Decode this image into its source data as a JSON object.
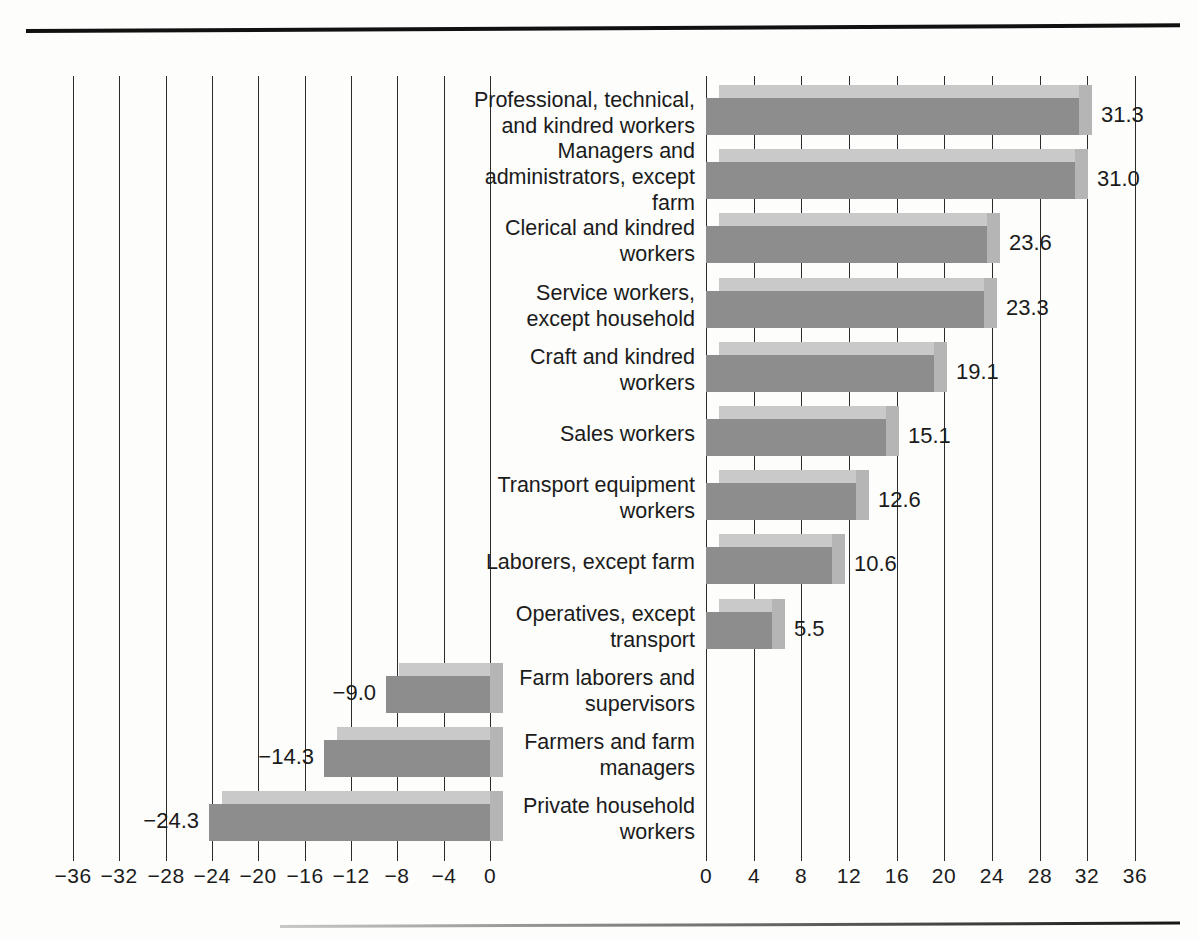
{
  "chart_data": {
    "type": "bar",
    "orientation": "horizontal",
    "title": "",
    "subtitle": "",
    "xlabel": "",
    "ylabel": "",
    "grid": true,
    "legend": null,
    "note": "Diverging horizontal bar chart with a split axis: negative values are plotted on a left panel (axis -36 to 0) and positive values on a right panel (axis 0 to 36). Category labels sit in the centre gutter between the two panels.",
    "axes": [
      {
        "side": "left",
        "ticks": [
          "-36",
          "-32",
          "-28",
          "-24",
          "-20",
          "-16",
          "-12",
          "-8",
          "-4",
          "0"
        ],
        "tick_values": [
          -36,
          -32,
          -28,
          -24,
          -20,
          -16,
          -12,
          -8,
          -4,
          0
        ],
        "xlim": [
          -36,
          0
        ]
      },
      {
        "side": "right",
        "ticks": [
          "0",
          "4",
          "8",
          "12",
          "16",
          "20",
          "24",
          "28",
          "32",
          "36"
        ],
        "tick_values": [
          0,
          4,
          8,
          12,
          16,
          20,
          24,
          28,
          32,
          36
        ],
        "xlim": [
          0,
          36
        ]
      }
    ],
    "categories": [
      "Professional, technical,\nand kindred workers",
      "Managers and\nadministrators, except\nfarm",
      "Clerical and kindred\nworkers",
      "Service workers,\nexcept household",
      "Craft and kindred\nworkers",
      "Sales workers",
      "Transport equipment\nworkers",
      "Laborers, except farm",
      "Operatives, except\ntransport",
      "Farm laborers and\nsupervisors",
      "Farmers and farm\nmanagers",
      "Private household\nworkers"
    ],
    "values": [
      31.3,
      31.0,
      23.6,
      23.3,
      19.1,
      15.1,
      12.6,
      10.6,
      5.5,
      -9.0,
      -14.3,
      -24.3
    ],
    "value_labels": [
      "31.3",
      "31.0",
      "23.6",
      "23.3",
      "19.1",
      "15.1",
      "12.6",
      "10.6",
      "5.5",
      "-9.0",
      "-14.3",
      "-24.3"
    ],
    "colors": {
      "bar_face": "#8d8d8d",
      "bar_top": "#c9c9c9",
      "bar_side": "#b5b5b5",
      "grid": "#2b2b2b",
      "text": "#1b1b1b",
      "background": "#fdfdfc"
    }
  }
}
